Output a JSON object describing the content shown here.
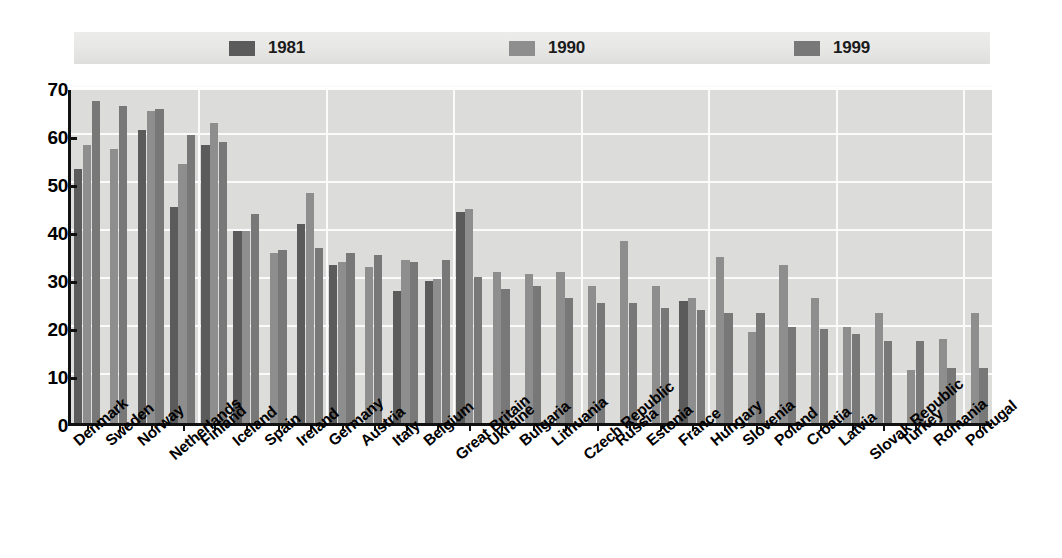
{
  "legend": {
    "items": [
      {
        "label": "1981",
        "color": "#5b5b5b"
      },
      {
        "label": "1990",
        "color": "#8e8e8e"
      },
      {
        "label": "1999",
        "color": "#787878"
      }
    ]
  },
  "yaxis": {
    "ticks": [
      "0",
      "10",
      "20",
      "30",
      "40",
      "50",
      "60",
      "70"
    ]
  },
  "chart_data": {
    "type": "bar",
    "title": "",
    "subtitle": "",
    "xlabel": "",
    "ylabel": "",
    "ylim": [
      0,
      70
    ],
    "ytick_values": [
      0,
      10,
      20,
      30,
      40,
      50,
      60,
      70
    ],
    "grid": true,
    "legend_position": "top",
    "legend_entries": [
      "1981",
      "1990",
      "1999"
    ],
    "categories": [
      "Denmark",
      "Sweden",
      "Norway",
      "Netherlands",
      "Finland",
      "Iceland",
      "Spain",
      "Ireland",
      "Germany",
      "Austria",
      "Italy",
      "Belgium",
      "Great Britain",
      "Ukraine",
      "Bulgaria",
      "Lithuania",
      "Czech Republic",
      "Russia",
      "Estonia",
      "France",
      "Hungary",
      "Slovenia",
      "Poland",
      "Croatia",
      "Latvia",
      "Slovak Republic",
      "Turkey",
      "Romania",
      "Portugal"
    ],
    "series": [
      {
        "name": "1981",
        "color": "#5b5b5b",
        "values": [
          53,
          null,
          61,
          45,
          58,
          40,
          null,
          41.5,
          33,
          null,
          27.5,
          29.5,
          44,
          null,
          null,
          null,
          null,
          null,
          null,
          25.5,
          null,
          null,
          null,
          null,
          null,
          null,
          null,
          null,
          null
        ]
      },
      {
        "name": "1990",
        "color": "#8e8e8e",
        "values": [
          58,
          57,
          65,
          54,
          62.5,
          40,
          35.5,
          48,
          33.5,
          32.5,
          34,
          30,
          44.5,
          31.5,
          31,
          31.5,
          28.5,
          38,
          28.5,
          26,
          34.5,
          19,
          33,
          26,
          20,
          23,
          11,
          17.5,
          23
        ]
      },
      {
        "name": "1999",
        "color": "#787878",
        "values": [
          67,
          66,
          65.5,
          60,
          58.5,
          43.5,
          36,
          36.5,
          35.5,
          35,
          33.5,
          34,
          30.5,
          28,
          28.5,
          26,
          25,
          25,
          24,
          23.5,
          23,
          23,
          20,
          19.5,
          18.5,
          17,
          17,
          11.5,
          11.5
        ]
      }
    ]
  }
}
